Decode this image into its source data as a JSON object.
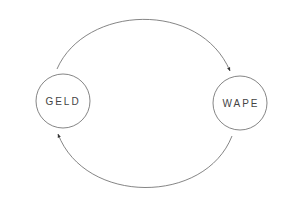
{
  "diagram": {
    "type": "cycle",
    "nodes": [
      {
        "id": "geld",
        "label": "GELD",
        "cx": 63,
        "cy": 101,
        "r": 27
      },
      {
        "id": "wape",
        "label": "WAPE",
        "cx": 240,
        "cy": 103,
        "r": 27
      }
    ],
    "edges": [
      {
        "from": "GELD",
        "to": "WAPE",
        "position": "top"
      },
      {
        "from": "WAPE",
        "to": "GELD",
        "position": "bottom"
      }
    ],
    "colors": {
      "stroke": "#555555",
      "text": "#444444",
      "background": "#ffffff"
    }
  }
}
